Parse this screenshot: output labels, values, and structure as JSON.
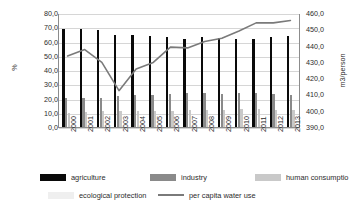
{
  "chart_data": {
    "type": "bar",
    "title": "",
    "xlabel": "",
    "ylabel": "%",
    "ylabel_right": "m3/person",
    "grid": true,
    "legend_position": "bottom",
    "categories": [
      "2000",
      "2001",
      "2002",
      "2003",
      "2004",
      "2005",
      "2006",
      "2007",
      "2008",
      "2009",
      "2010",
      "2011",
      "2012",
      "2013"
    ],
    "ylim": [
      0,
      80
    ],
    "yticks": [
      "0,0",
      "10,0",
      "20,0",
      "30,0",
      "40,0",
      "50,0",
      "60,0",
      "70,0",
      "80,0"
    ],
    "ylim_right": [
      390,
      460
    ],
    "yticks_right": [
      "390,0",
      "400,0",
      "410,0",
      "420,0",
      "430,0",
      "440,0",
      "450,0",
      "460,0"
    ],
    "series": [
      {
        "name": "agriculture",
        "axis": "left",
        "type": "bar",
        "color": "#0a0a0a",
        "values": [
          68.8,
          68.8,
          68.1,
          64.6,
          64.6,
          63.6,
          63.2,
          61.9,
          62.9,
          62.5,
          61.7,
          61.6,
          63.5,
          63.9
        ]
      },
      {
        "name": "industry",
        "axis": "left",
        "type": "bar",
        "color": "#8a8a8a",
        "values": [
          20.4,
          20.4,
          20.7,
          22.0,
          22.2,
          22.8,
          23.4,
          24.2,
          23.6,
          23.3,
          24.0,
          23.9,
          23.5,
          22.8
        ]
      },
      {
        "name": "human consumptio",
        "axis": "left",
        "type": "bar",
        "color": "#c9c9c9",
        "values": [
          10.0,
          10.3,
          10.9,
          11.0,
          11.3,
          11.4,
          11.5,
          11.6,
          12.1,
          12.2,
          12.4,
          12.4,
          12.1,
          12.2
        ]
      },
      {
        "name": "ecological protection",
        "axis": "left",
        "type": "bar",
        "color": "#efefef",
        "values": [
          0.4,
          0.4,
          0.4,
          0.5,
          0.6,
          0.7,
          0.8,
          0.9,
          1.1,
          1.3,
          1.5,
          1.6,
          1.7,
          1.8
        ]
      },
      {
        "name": "per capita water use",
        "axis": "right",
        "type": "line",
        "color": "#7a7a7a",
        "values": [
          434.0,
          438.0,
          430.0,
          412.5,
          426.0,
          430.0,
          439.5,
          439.0,
          443.0,
          445.0,
          449.5,
          454.5,
          454.5,
          456.0
        ]
      }
    ]
  },
  "legend": {
    "row1": [
      {
        "label": "agriculture",
        "style": "bar",
        "color": "#0a0a0a"
      },
      {
        "label": "industry",
        "style": "bar",
        "color": "#8a8a8a"
      },
      {
        "label": "human consumptio",
        "style": "bar",
        "color": "#c9c9c9"
      }
    ],
    "row2": [
      {
        "label": "ecological protection",
        "style": "bar",
        "color": "#efefef"
      },
      {
        "label": "per capita water use",
        "style": "line",
        "color": "#7a7a7a"
      }
    ]
  }
}
